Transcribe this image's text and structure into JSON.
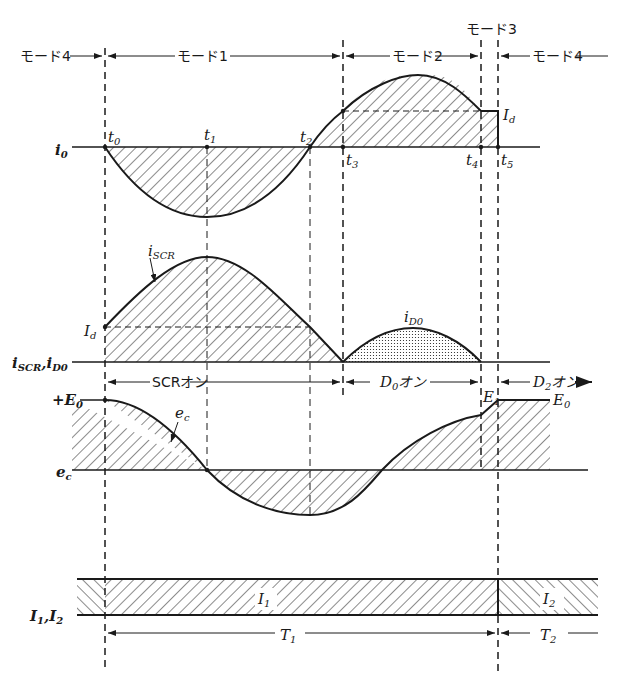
{
  "modes": {
    "mode4_left": "モード4",
    "mode1": "モード1",
    "mode2": "モード2",
    "mode3": "モード3",
    "mode4_right": "モード4"
  },
  "time_markers": {
    "t0": "t",
    "t0_sub": "0",
    "t1": "t",
    "t1_sub": "1",
    "t2": "t",
    "t2_sub": "2",
    "t3": "t",
    "t3_sub": "3",
    "t4": "t",
    "t4_sub": "4",
    "t5": "t",
    "t5_sub": "5"
  },
  "waveforms": {
    "i0": {
      "axis_label": "i",
      "axis_sub": "0",
      "level_label": "I",
      "level_sub": "d"
    },
    "iscr": {
      "axis_label": "i",
      "axis_sub": "SCR",
      "axis_label2": ",i",
      "axis_sub2": "D0",
      "curve_label": "i",
      "curve_sub": "SCR",
      "id_label": "I",
      "id_sub": "d",
      "diode_label": "i",
      "diode_sub": "D0",
      "scr_on": "SCRオン",
      "d0_on_prefix": "D",
      "d0_on_sub": "0",
      "d0_on_suffix": "オン",
      "d2_on_prefix": "D",
      "d2_on_sub": "2",
      "d2_on_suffix": "オン"
    },
    "ec": {
      "axis_label": "e",
      "axis_sub": "c",
      "plus_e0": "+E",
      "plus_e0_sub": "0",
      "curve_label": "e",
      "curve_sub": "c",
      "e1": "E",
      "e1_sub": "1",
      "e0": "E",
      "e0_sub": "0"
    },
    "bars": {
      "axis_label": "I",
      "axis_sub": "1",
      "axis_label2": ",I",
      "axis_sub2": "2",
      "i1": "I",
      "i1_sub": "1",
      "i2": "I",
      "i2_sub": "2",
      "t1": "T",
      "t1_sub": "1",
      "t2": "T",
      "t2_sub": "2"
    }
  },
  "colors": {
    "ink": "#1a1a1a",
    "background": "#ffffff"
  }
}
